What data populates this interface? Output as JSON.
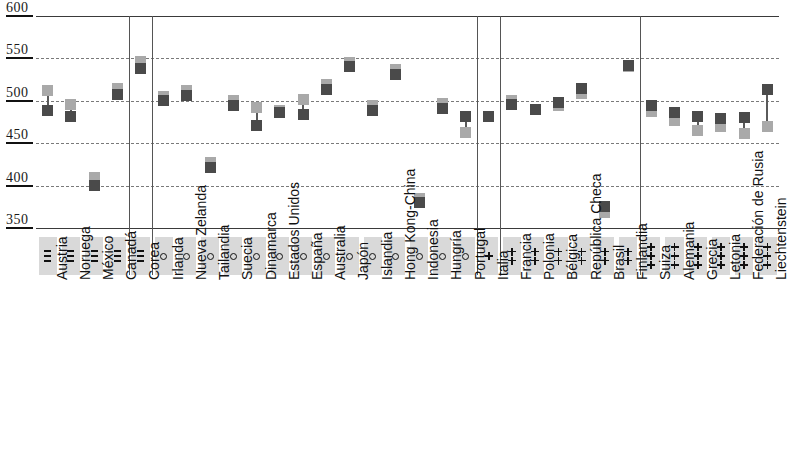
{
  "chart_data": {
    "type": "scatter",
    "title": "",
    "subtitle": "",
    "xlabel": "",
    "ylabel": "",
    "ylim": [
      350,
      600
    ],
    "yticks": [
      600,
      550,
      500,
      450,
      400,
      350
    ],
    "grid": true,
    "legend_position": "none",
    "series": [
      {
        "name": "light-marker",
        "color": "#a9a9a9",
        "values": [
          512,
          496,
          410,
          515,
          546,
          505,
          512,
          427,
          500,
          492,
          488,
          502,
          519,
          545,
          494,
          537,
          385,
          497,
          463,
          481,
          500,
          490,
          495,
          509,
          368,
          540,
          487,
          477,
          465,
          470,
          462,
          470
        ]
      },
      {
        "name": "dark-marker",
        "color": "#4a4a4a",
        "values": [
          489,
          481,
          400,
          508,
          538,
          500,
          506,
          421,
          494,
          471,
          486,
          484,
          513,
          541,
          488,
          531,
          380,
          491,
          481,
          482,
          496,
          490,
          498,
          514,
          375,
          542,
          495,
          486,
          481,
          479,
          480,
          513
        ]
      }
    ],
    "categories": [
      "Austria",
      "Noruega",
      "México",
      "Canadá",
      "Corea",
      "Irlanda",
      "Nueva Zelanda",
      "Tailandia",
      "Suecia",
      "Dinamarca",
      "Estados Unidos",
      "España",
      "Australia",
      "Japón",
      "Islandia",
      "Hong Kong-China",
      "Indonesia",
      "Hungría",
      "Portugal",
      "Italia",
      "Francia",
      "Polonia",
      "Bélgica",
      "República Checa",
      "Brasil",
      "Finlandia",
      "Suiza",
      "Alemania",
      "Grecia",
      "Letonia",
      "Federación de Rusia",
      "Liechtenstein"
    ],
    "symbols": [
      "---",
      "---",
      "---",
      "---",
      "---",
      "o",
      "o",
      "o",
      "o",
      "o",
      "o",
      "o",
      "o",
      "o",
      "o",
      "o",
      "o",
      "o",
      "o",
      "+",
      "++",
      "++",
      "++",
      "++",
      "++",
      "++",
      "+++",
      "+++",
      "+++",
      "+++",
      "+++",
      "+++"
    ],
    "group_separator_after": [
      3,
      4,
      18,
      19,
      25
    ],
    "colors": {
      "light_marker": "#a9a9a9",
      "dark_marker": "#4a4a4a",
      "connector": "#5a5a5a",
      "gridline": "#7a7a7a",
      "axis": "#3a3a3a",
      "symbol_band": "#d9d9d9",
      "text": "#111111"
    }
  },
  "axis": {
    "tick_labels": [
      "600",
      "550",
      "500",
      "450",
      "400",
      "350"
    ]
  }
}
